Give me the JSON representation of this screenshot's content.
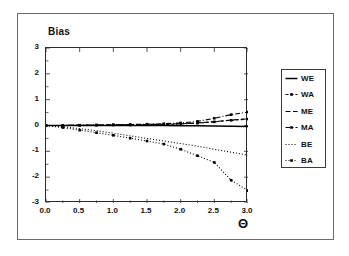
{
  "figure": {
    "background": "#ffffff",
    "frame_color": "#6b6b6b",
    "axis_color": "#2a2a2a"
  },
  "chart_data": {
    "type": "line",
    "title": "",
    "ylabel": "Bias",
    "xlabel": "Θ",
    "xlim": [
      0.0,
      3.0
    ],
    "ylim": [
      -3,
      3
    ],
    "grid": false,
    "legend_position": "right-outside",
    "xticks": [
      "0.0",
      "0.5",
      "1.0",
      "1.5",
      "2.0",
      "2.5",
      "3.0"
    ],
    "xtick_values": [
      0.0,
      0.5,
      1.0,
      1.5,
      2.0,
      2.5,
      3.0
    ],
    "yticks": [
      "3",
      "2",
      "1",
      "0",
      "-1",
      "-2",
      "-3"
    ],
    "ytick_values": [
      3,
      2,
      1,
      0,
      -1,
      -2,
      -3
    ],
    "x": [
      0.0,
      0.25,
      0.5,
      0.75,
      1.0,
      1.25,
      1.5,
      1.75,
      2.0,
      2.25,
      2.5,
      2.75,
      3.0
    ],
    "series": [
      {
        "name": "WE",
        "label": "WE",
        "style": "solid",
        "marker": "none",
        "color": "#000000",
        "values": [
          0.0,
          0.0,
          0.0,
          0.0,
          0.0,
          0.0,
          0.0,
          0.0,
          -0.01,
          -0.01,
          -0.02,
          -0.03,
          -0.04
        ]
      },
      {
        "name": "WA",
        "label": "WA",
        "style": "dashed",
        "marker": "square",
        "color": "#000000",
        "values": [
          0.0,
          0.0,
          0.01,
          0.01,
          0.02,
          0.02,
          0.03,
          0.04,
          0.06,
          0.09,
          0.14,
          0.2,
          0.25
        ]
      },
      {
        "name": "ME",
        "label": "ME",
        "style": "dashed-long",
        "marker": "none",
        "color": "#000000",
        "values": [
          0.0,
          0.0,
          0.01,
          0.01,
          0.02,
          0.03,
          0.04,
          0.05,
          0.07,
          0.1,
          0.15,
          0.21,
          0.26
        ]
      },
      {
        "name": "MA",
        "label": "MA",
        "style": "dash-dot",
        "marker": "square",
        "color": "#000000",
        "values": [
          0.0,
          0.0,
          0.01,
          0.02,
          0.03,
          0.04,
          0.05,
          0.07,
          0.1,
          0.16,
          0.28,
          0.42,
          0.52
        ]
      },
      {
        "name": "BE",
        "label": "BE",
        "style": "dotted",
        "marker": "none",
        "color": "#000000",
        "values": [
          0.0,
          -0.05,
          -0.12,
          -0.2,
          -0.3,
          -0.4,
          -0.5,
          -0.6,
          -0.7,
          -0.8,
          -0.92,
          -1.03,
          -1.15
        ]
      },
      {
        "name": "BA",
        "label": "BA",
        "style": "dotted",
        "marker": "square",
        "color": "#000000",
        "values": [
          0.0,
          -0.08,
          -0.18,
          -0.28,
          -0.38,
          -0.49,
          -0.6,
          -0.72,
          -0.92,
          -1.17,
          -1.43,
          -2.12,
          -2.52
        ]
      }
    ]
  }
}
